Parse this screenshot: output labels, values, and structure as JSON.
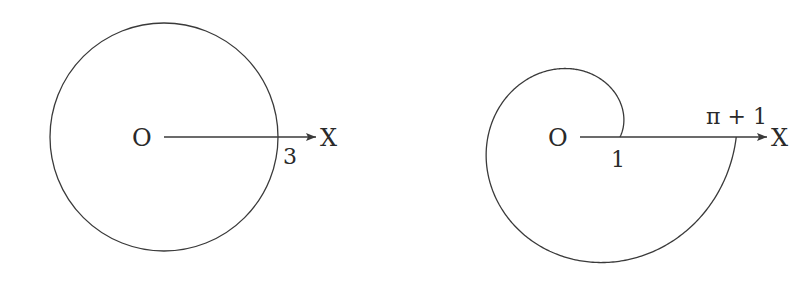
{
  "figures": [
    {
      "name": "circle-figure",
      "origin_label": "O",
      "axis_label": "X",
      "radius_label": "3",
      "curve": "circle r = 3"
    },
    {
      "name": "spiral-figure",
      "origin_label": "O",
      "axis_label": "X",
      "start_label": "1",
      "end_label": "π + 1",
      "curve": "spiral r = 1 + θ/2, 0 ≤ θ ≤ 2π"
    }
  ],
  "colors": {
    "stroke": "#3a3a3a",
    "background": "#ffffff"
  }
}
